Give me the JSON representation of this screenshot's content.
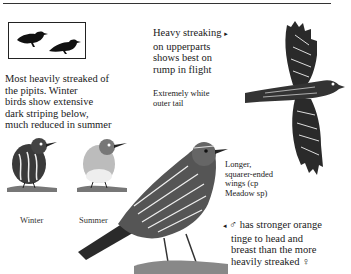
{
  "silhouettes": {
    "icon": "bird-silhouette-icon",
    "count": 2
  },
  "annotations": {
    "streaked_note": [
      "Most heavily streaked of",
      "the pipits. Winter",
      "birds show extensive",
      "dark striping below,",
      "much reduced in summer"
    ],
    "upperparts_note": [
      "Heavy streaking",
      "on upperparts",
      "shows best on",
      "rump in flight"
    ],
    "upperparts_arrow": "▸",
    "tail_note": [
      "Extremely white",
      "outer tail"
    ],
    "wings_note": [
      "Longer,",
      "squarer-ended",
      "wings (cp",
      "Meadow sp)"
    ],
    "male_note": [
      "♂ has stronger orange",
      "tinge to head and",
      "breast than the more",
      "heavily streaked ♀"
    ],
    "male_arrow": "◂"
  },
  "labels": {
    "winter": "Winter",
    "summer": "Summer"
  },
  "colors": {
    "ink": "#1a1a1a",
    "paper": "#ffffff",
    "bird_gray": "#555555"
  }
}
